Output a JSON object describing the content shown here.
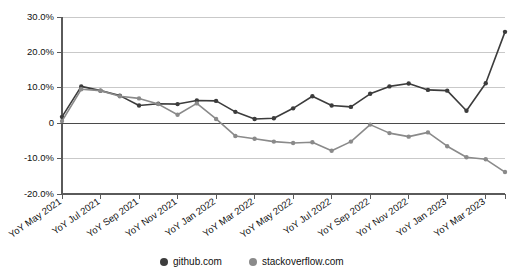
{
  "chart_data": {
    "type": "line",
    "title": "",
    "subtitle": "",
    "xlabel": "",
    "ylabel": "",
    "grid": true,
    "legend_position": "bottom",
    "ylim": [
      -20,
      30
    ],
    "y_ticks": [
      30,
      20,
      10,
      0,
      -10,
      -20
    ],
    "y_tick_labels": [
      "30.0%",
      "20.0%",
      "10.0%",
      "0",
      "-10.0%",
      "-20.0%"
    ],
    "categories": [
      "YoY May 2021",
      "YoY Jun 2021",
      "YoY Jul 2021",
      "YoY Aug 2021",
      "YoY Sep 2021",
      "YoY Oct 2021",
      "YoY Nov 2021",
      "YoY Dec 2021",
      "YoY Jan 2022",
      "YoY Feb 2022",
      "YoY Mar 2022",
      "YoY Apr 2022",
      "YoY May 2022",
      "YoY Jun 2022",
      "YoY Jul 2022",
      "YoY Aug 2022",
      "YoY Sep 2022",
      "YoY Oct 2022",
      "YoY Nov 2022",
      "YoY Dec 2022",
      "YoY Jan 2023",
      "YoY Feb 2023",
      "YoY Mar 2023",
      "YoY Apr 2023"
    ],
    "x_tick_labels": [
      "YoY May 2021",
      "YoY Jul 2021",
      "YoY Sep 2021",
      "YoY Nov 2021",
      "YoY Jan 2022",
      "YoY Mar 2022",
      "YoY May 2022",
      "YoY Jul 2022",
      "YoY Sep 2022",
      "YoY Nov 2022",
      "YoY Jan 2023",
      "YoY Mar 2023"
    ],
    "series": [
      {
        "name": "github.com",
        "color": "#3c3c3c",
        "values": [
          1.8,
          10.4,
          9.2,
          7.8,
          5.0,
          5.5,
          5.4,
          6.4,
          6.3,
          3.2,
          1.2,
          1.4,
          4.2,
          7.6,
          5.0,
          4.6,
          8.3,
          10.4,
          11.2,
          9.4,
          9.2,
          3.5,
          11.3,
          25.8
        ]
      },
      {
        "name": "stackoverflow.com",
        "color": "#8a8a8a",
        "values": [
          0.6,
          9.6,
          9.2,
          7.6,
          7.0,
          5.4,
          2.4,
          5.6,
          1.2,
          -3.6,
          -4.4,
          -5.2,
          -5.6,
          -5.4,
          -7.8,
          -5.2,
          -0.4,
          -2.8,
          -3.8,
          -2.6,
          -6.5,
          -9.6,
          -10.2,
          -13.8
        ]
      }
    ]
  },
  "legend": {
    "items": [
      {
        "label": "github.com",
        "color": "#3c3c3c"
      },
      {
        "label": "stackoverflow.com",
        "color": "#8a8a8a"
      }
    ]
  }
}
